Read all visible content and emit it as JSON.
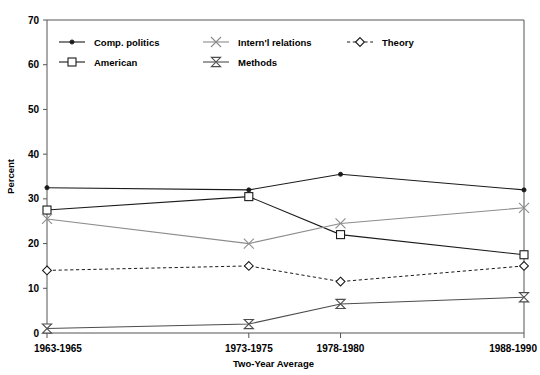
{
  "chart_data": {
    "type": "line",
    "title": "",
    "xlabel": "Two-Year Average",
    "ylabel": "Percent",
    "categories": [
      "1963-1965",
      "1973-1975",
      "1978-1980",
      "1988-1990"
    ],
    "x_positions": [
      1963,
      1974,
      1979,
      1989
    ],
    "xlim": [
      1963,
      1989
    ],
    "ylim": [
      0,
      70
    ],
    "yticks": [
      0,
      10,
      20,
      30,
      40,
      50,
      60,
      70
    ],
    "ytick_labels": [
      "0",
      "10",
      "20",
      "30",
      "40",
      "50",
      "60",
      "70"
    ],
    "grid": false,
    "legend_position": "top-inside",
    "series": [
      {
        "name": "Comp. politics",
        "marker": "dot",
        "line": "solid",
        "color": "#1a1a1a",
        "values": [
          32.5,
          32.0,
          35.5,
          32.0
        ]
      },
      {
        "name": "American",
        "marker": "square",
        "line": "solid",
        "color": "#1a1a1a",
        "values": [
          27.5,
          30.5,
          22.0,
          17.5
        ]
      },
      {
        "name": "Intern'l relations",
        "marker": "x",
        "line": "solid",
        "color": "#8c8c8c",
        "values": [
          25.5,
          20.0,
          24.5,
          28.0
        ]
      },
      {
        "name": "Methods",
        "marker": "bowtie",
        "line": "solid",
        "color": "#4d4d4d",
        "values": [
          1.0,
          2.0,
          6.5,
          8.0
        ]
      },
      {
        "name": "Theory",
        "marker": "diamond",
        "line": "dashed",
        "color": "#1a1a1a",
        "values": [
          14.0,
          15.0,
          11.5,
          15.0
        ]
      }
    ]
  },
  "legend": {
    "entries": [
      {
        "label": "Comp. politics",
        "col": 0,
        "row": 0
      },
      {
        "label": "American",
        "col": 0,
        "row": 1
      },
      {
        "label": "Intern'l relations",
        "col": 1,
        "row": 0
      },
      {
        "label": "Methods",
        "col": 1,
        "row": 1
      },
      {
        "label": "Theory",
        "col": 2,
        "row": 0
      }
    ]
  },
  "axes": {
    "y_axis_label": "Percent",
    "x_axis_label": "Two-Year Average"
  }
}
